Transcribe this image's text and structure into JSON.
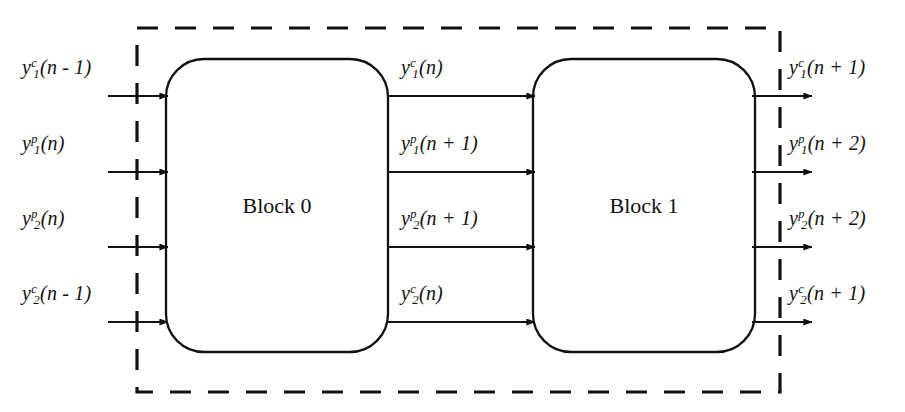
{
  "diagram": {
    "boundary": {
      "style": "dashed",
      "color": "#111111"
    },
    "blocks": [
      {
        "id": "block0",
        "label": "Block 0",
        "cx": 277,
        "cy": 206
      },
      {
        "id": "block1",
        "label": "Block 1",
        "cx": 644,
        "cy": 206
      }
    ],
    "inputs": [
      {
        "id": "in-1",
        "base": "y",
        "sub": "1",
        "sup": "c",
        "arg": "(n - 1)",
        "row": 0
      },
      {
        "id": "in-2",
        "base": "y",
        "sub": "1",
        "sup": "p",
        "arg": "(n)",
        "row": 1
      },
      {
        "id": "in-3",
        "base": "y",
        "sub": "2",
        "sup": "p",
        "arg": "(n)",
        "row": 2
      },
      {
        "id": "in-4",
        "base": "y",
        "sub": "2",
        "sup": "c",
        "arg": "(n - 1)",
        "row": 3
      }
    ],
    "intermediates": [
      {
        "id": "mid-1",
        "base": "y",
        "sub": "1",
        "sup": "c",
        "arg": "(n)",
        "row": 0
      },
      {
        "id": "mid-2",
        "base": "y",
        "sub": "1",
        "sup": "p",
        "arg": "(n + 1)",
        "row": 1
      },
      {
        "id": "mid-3",
        "base": "y",
        "sub": "2",
        "sup": "p",
        "arg": "(n + 1)",
        "row": 2
      },
      {
        "id": "mid-4",
        "base": "y",
        "sub": "2",
        "sup": "c",
        "arg": "(n)",
        "row": 3
      }
    ],
    "outputs": [
      {
        "id": "out-1",
        "base": "y",
        "sub": "1",
        "sup": "c",
        "arg": "(n + 1)",
        "row": 0
      },
      {
        "id": "out-2",
        "base": "y",
        "sub": "1",
        "sup": "p",
        "arg": "(n + 2)",
        "row": 1
      },
      {
        "id": "out-3",
        "base": "y",
        "sub": "2",
        "sup": "p",
        "arg": "(n + 2)",
        "row": 2
      },
      {
        "id": "out-4",
        "base": "y",
        "sub": "2",
        "sup": "c",
        "arg": "(n + 1)",
        "row": 3
      }
    ]
  }
}
